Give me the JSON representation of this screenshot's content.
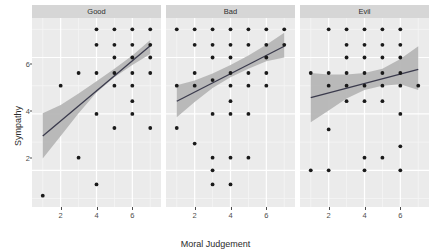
{
  "chart_data": {
    "type": "scatter",
    "title": "",
    "xlabel": "Moral Judgement",
    "ylabel": "Sympathy",
    "xlim": [
      0.4,
      7.6
    ],
    "ylim": [
      0.7,
      7.4
    ],
    "xticks": [
      2,
      4,
      6
    ],
    "yticks": [
      2,
      4,
      6
    ],
    "grid": true,
    "legend": "none",
    "facet_variable": "",
    "colors": {
      "panel_background": "#ebebeb",
      "grid_major": "#ffffff",
      "grid_minor": "#f5f5f5",
      "strip_background": "#d6d6d6",
      "point": "#1a1a1a",
      "line": "#3b3b4d",
      "ribbon": "#b6b6b6",
      "text": "#2b2b2b",
      "tick_text": "#4d4d4d"
    },
    "facets": [
      {
        "label": "Good",
        "points": [
          [
            1,
            1.1
          ],
          [
            2,
            5.0
          ],
          [
            3,
            5.45
          ],
          [
            3,
            2.45
          ],
          [
            4,
            7.0
          ],
          [
            4,
            6.45
          ],
          [
            4,
            5.45
          ],
          [
            4,
            4.0
          ],
          [
            4,
            1.5
          ],
          [
            5,
            7.0
          ],
          [
            5,
            6.45
          ],
          [
            5,
            6.0
          ],
          [
            5,
            5.45
          ],
          [
            5,
            5.0
          ],
          [
            5,
            3.5
          ],
          [
            6,
            7.0
          ],
          [
            6,
            6.45
          ],
          [
            6,
            6.0
          ],
          [
            6,
            5.45
          ],
          [
            6,
            5.0
          ],
          [
            6,
            4.45
          ],
          [
            6,
            4.0
          ],
          [
            7,
            7.0
          ],
          [
            7,
            6.45
          ],
          [
            7,
            6.0
          ],
          [
            7,
            5.45
          ],
          [
            7,
            3.5
          ]
        ],
        "fit_line": [
          [
            1,
            3.22
          ],
          [
            7,
            6.42
          ]
        ],
        "ribbon_upper": [
          [
            1,
            4.02
          ],
          [
            2,
            4.32
          ],
          [
            3,
            4.72
          ],
          [
            4,
            5.16
          ],
          [
            5,
            5.6
          ],
          [
            6,
            6.07
          ],
          [
            7,
            6.62
          ]
        ],
        "ribbon_lower": [
          [
            1,
            2.42
          ],
          [
            2,
            3.22
          ],
          [
            3,
            4.02
          ],
          [
            4,
            4.76
          ],
          [
            5,
            5.3
          ],
          [
            6,
            5.73
          ],
          [
            7,
            6.12
          ]
        ]
      },
      {
        "label": "Bad",
        "points": [
          [
            1,
            7.0
          ],
          [
            1,
            5.0
          ],
          [
            1,
            3.5
          ],
          [
            2,
            7.0
          ],
          [
            2,
            6.45
          ],
          [
            2,
            5.45
          ],
          [
            2,
            5.0
          ],
          [
            2,
            2.95
          ],
          [
            3,
            7.0
          ],
          [
            3,
            6.45
          ],
          [
            3,
            6.0
          ],
          [
            3,
            5.2
          ],
          [
            3,
            4.0
          ],
          [
            3,
            2.45
          ],
          [
            3,
            2.0
          ],
          [
            3,
            1.5
          ],
          [
            4,
            7.0
          ],
          [
            4,
            6.45
          ],
          [
            4,
            6.0
          ],
          [
            4,
            5.45
          ],
          [
            4,
            5.0
          ],
          [
            4,
            4.45
          ],
          [
            4,
            4.0
          ],
          [
            4,
            2.45
          ],
          [
            4,
            1.5
          ],
          [
            5,
            7.0
          ],
          [
            5,
            6.45
          ],
          [
            5,
            5.45
          ],
          [
            5,
            5.0
          ],
          [
            5,
            4.0
          ],
          [
            5,
            2.45
          ],
          [
            6,
            7.0
          ],
          [
            6,
            6.45
          ],
          [
            6,
            6.0
          ],
          [
            6,
            5.45
          ],
          [
            6,
            5.0
          ],
          [
            7,
            7.0
          ],
          [
            7,
            6.45
          ]
        ],
        "fit_line": [
          [
            1,
            4.45
          ],
          [
            7,
            6.4
          ]
        ],
        "ribbon_upper": [
          [
            1,
            5.02
          ],
          [
            2,
            5.18
          ],
          [
            3,
            5.43
          ],
          [
            4,
            5.73
          ],
          [
            5,
            6.07
          ],
          [
            6,
            6.45
          ],
          [
            7,
            6.88
          ]
        ],
        "ribbon_lower": [
          [
            1,
            3.88
          ],
          [
            2,
            4.42
          ],
          [
            3,
            4.92
          ],
          [
            4,
            5.3
          ],
          [
            5,
            5.6
          ],
          [
            6,
            5.87
          ],
          [
            7,
            6.0
          ]
        ]
      },
      {
        "label": "Evil",
        "points": [
          [
            1,
            5.45
          ],
          [
            1,
            2.0
          ],
          [
            2,
            7.0
          ],
          [
            2,
            5.45
          ],
          [
            2,
            5.0
          ],
          [
            2,
            3.45
          ],
          [
            2,
            2.0
          ],
          [
            3,
            7.0
          ],
          [
            3,
            6.45
          ],
          [
            3,
            6.0
          ],
          [
            3,
            5.45
          ],
          [
            3,
            5.0
          ],
          [
            3,
            4.45
          ],
          [
            4,
            7.0
          ],
          [
            4,
            6.45
          ],
          [
            4,
            6.0
          ],
          [
            4,
            5.45
          ],
          [
            4,
            5.0
          ],
          [
            4,
            4.45
          ],
          [
            4,
            2.45
          ],
          [
            4,
            2.0
          ],
          [
            5,
            7.0
          ],
          [
            5,
            6.45
          ],
          [
            5,
            6.0
          ],
          [
            5,
            5.45
          ],
          [
            5,
            5.0
          ],
          [
            5,
            4.45
          ],
          [
            5,
            2.45
          ],
          [
            6,
            7.0
          ],
          [
            6,
            6.45
          ],
          [
            6,
            6.0
          ],
          [
            6,
            5.45
          ],
          [
            6,
            5.0
          ],
          [
            6,
            4.0
          ],
          [
            6,
            2.85
          ],
          [
            6,
            2.0
          ],
          [
            7,
            5.0
          ]
        ],
        "fit_line": [
          [
            1,
            4.58
          ],
          [
            7,
            5.58
          ]
        ],
        "ribbon_upper": [
          [
            1,
            5.45
          ],
          [
            2,
            5.4
          ],
          [
            3,
            5.4
          ],
          [
            4,
            5.45
          ],
          [
            5,
            5.6
          ],
          [
            6,
            5.95
          ],
          [
            7,
            6.4
          ]
        ],
        "ribbon_lower": [
          [
            1,
            3.7
          ],
          [
            2,
            4.12
          ],
          [
            3,
            4.55
          ],
          [
            4,
            4.85
          ],
          [
            5,
            5.0
          ],
          [
            6,
            5.05
          ],
          [
            7,
            4.85
          ]
        ]
      }
    ]
  }
}
